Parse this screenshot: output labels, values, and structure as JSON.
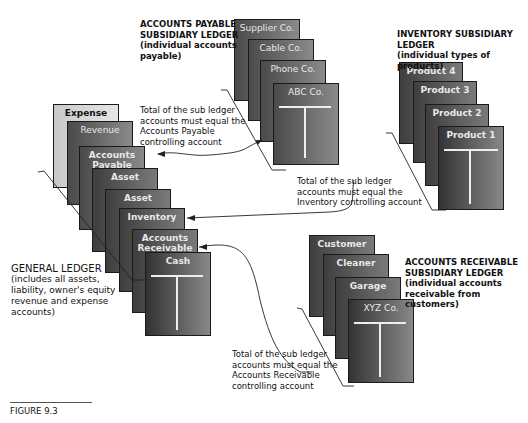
{
  "figure": {
    "caption": "FIGURE 9.3"
  },
  "general_ledger": {
    "title": "GENERAL LEDGER",
    "description": [
      "(includes all assets,",
      "liability, owner's equity",
      "revenue and expense",
      "accounts)"
    ],
    "accounts": [
      "Expense",
      "Revenue",
      "Accounts Payable",
      "Asset",
      "Asset",
      "Inventory",
      "Accounts Receivable",
      "Cash"
    ]
  },
  "accounts_payable": {
    "heading": [
      "ACCOUNTS PAYABLE",
      "SUBSIDIARY LEDGER",
      "(individual accounts",
      "payable)"
    ],
    "accounts": [
      "Supplier Co.",
      "Cable Co.",
      "Phone Co.",
      "ABC Co."
    ],
    "note": [
      "Total of the sub ledger",
      "accounts must equal the",
      "Accounts Payable",
      "controlling account"
    ]
  },
  "inventory": {
    "heading": [
      "INVENTORY SUBSIDIARY",
      "LEDGER",
      "(individual types of products)"
    ],
    "accounts": [
      "Product 4",
      "Product 3",
      "Product 2",
      "Product 1"
    ],
    "note": [
      "Total of the sub ledger",
      "accounts must equal the",
      "Inventory controlling account"
    ]
  },
  "accounts_receivable": {
    "heading": [
      "ACCOUNTS RECEIVABLE",
      "SUBSIDIARY LEDGER",
      "(individual accounts",
      "receivable from customers)"
    ],
    "accounts": [
      "Customer",
      "Cleaner",
      "Garage",
      "XYZ Co."
    ],
    "note": [
      "Total of the sub ledger",
      "accounts must equal the",
      "Accounts Receivable",
      "controlling account"
    ]
  },
  "colors": {
    "card_dark": "#3e3e3e",
    "card_light": "#8a8a8a",
    "expense_card": "#d0d0d0",
    "line": "#222222"
  }
}
